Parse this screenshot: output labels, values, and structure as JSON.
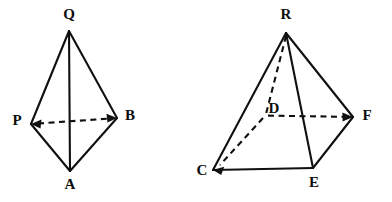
{
  "figure": {
    "background_color": "#ffffff",
    "line_color": "#101010",
    "label_color": "#0d0d0d",
    "solid_stroke_width": 2.1,
    "hidden_stroke_width": 2.1,
    "hidden_dash_pattern": "6 4.5"
  },
  "figures": [
    {
      "name": "tetrahedron-left",
      "label": "Left tetrahedron QPAB",
      "vertices": [
        {
          "id": "Q",
          "label": "Q",
          "x": 69,
          "y": 31,
          "label_x": 69,
          "label_y": 16
        },
        {
          "id": "P",
          "label": "P",
          "x": 31,
          "y": 124,
          "label_x": 17,
          "label_y": 122
        },
        {
          "id": "B",
          "label": "B",
          "x": 117,
          "y": 118,
          "label_x": 130,
          "label_y": 117
        },
        {
          "id": "A",
          "label": "A",
          "x": 70,
          "y": 171,
          "label_x": 70,
          "label_y": 186
        }
      ],
      "solid_edges": [
        {
          "from": "Q",
          "to": "P"
        },
        {
          "from": "Q",
          "to": "B"
        },
        {
          "from": "Q",
          "to": "A"
        },
        {
          "from": "P",
          "to": "A"
        },
        {
          "from": "B",
          "to": "A"
        }
      ],
      "hidden_edges": [
        {
          "from": "P",
          "to": "B",
          "arrows": "both"
        }
      ]
    },
    {
      "name": "pyramid-right",
      "label": "Right square pyramid R-CDFE",
      "vertices": [
        {
          "id": "R",
          "label": "R",
          "x": 286,
          "y": 33,
          "label_x": 286,
          "label_y": 16
        },
        {
          "id": "D",
          "label": "D",
          "x": 265,
          "y": 115,
          "label_x": 274,
          "label_y": 110
        },
        {
          "id": "F",
          "label": "F",
          "x": 353,
          "y": 117,
          "label_x": 367,
          "label_y": 117
        },
        {
          "id": "C",
          "label": "C",
          "x": 213,
          "y": 170,
          "label_x": 202,
          "label_y": 172
        },
        {
          "id": "E",
          "label": "E",
          "x": 313,
          "y": 168,
          "label_x": 314,
          "label_y": 184
        }
      ],
      "solid_edges": [
        {
          "from": "R",
          "to": "C"
        },
        {
          "from": "R",
          "to": "F"
        },
        {
          "from": "R",
          "to": "E"
        },
        {
          "from": "C",
          "to": "E"
        },
        {
          "from": "E",
          "to": "F"
        }
      ],
      "hidden_edges": [
        {
          "from": "R",
          "to": "D",
          "arrows": "none"
        },
        {
          "from": "D",
          "to": "C",
          "arrows": "to"
        },
        {
          "from": "D",
          "to": "F",
          "arrows": "to"
        }
      ]
    }
  ]
}
